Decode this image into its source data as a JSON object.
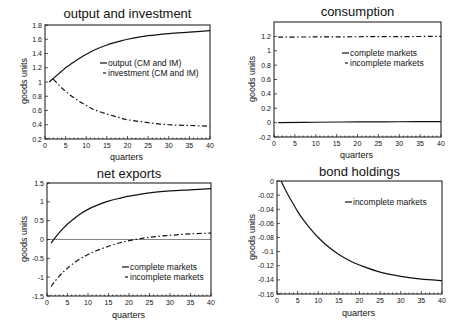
{
  "chart_data": [
    {
      "id": "output",
      "type": "line",
      "title": "output and investment",
      "xlabel": "quarters",
      "ylabel": "goods units",
      "xlim": [
        0,
        40
      ],
      "ylim": [
        0.2,
        1.8
      ],
      "xticks": [
        0,
        5,
        10,
        15,
        20,
        25,
        30,
        35,
        40
      ],
      "yticks": [
        0.2,
        0.4,
        0.6,
        0.8,
        1,
        1.2,
        1.4,
        1.6,
        1.8
      ],
      "ytick_labels": [
        "0.2",
        "0.4",
        "0.6",
        "0.8",
        "1",
        "1.2",
        "1.4",
        "1.6",
        "1.8"
      ],
      "grid": false,
      "legend_position": "center-right",
      "frame": {
        "left": 45,
        "top": 25,
        "right": 210,
        "bottom": 139
      },
      "legend": {
        "x": 100,
        "y": 66
      },
      "series": [
        {
          "name": "output (CM and IM)",
          "style": "solid",
          "x": [
            1,
            2,
            3,
            4,
            5,
            6,
            8,
            10,
            12,
            15,
            18,
            20,
            25,
            30,
            35,
            40
          ],
          "values": [
            1.0,
            1.05,
            1.1,
            1.15,
            1.2,
            1.24,
            1.32,
            1.39,
            1.45,
            1.52,
            1.57,
            1.6,
            1.65,
            1.68,
            1.7,
            1.72
          ]
        },
        {
          "name": "investment (CM and IM)",
          "style": "dashdot",
          "x": [
            2,
            3,
            4,
            5,
            6,
            8,
            10,
            12,
            15,
            18,
            20,
            25,
            30,
            35,
            40
          ],
          "values": [
            1.04,
            0.98,
            0.92,
            0.87,
            0.82,
            0.74,
            0.67,
            0.61,
            0.55,
            0.5,
            0.47,
            0.43,
            0.4,
            0.39,
            0.38
          ]
        }
      ]
    },
    {
      "id": "consumption",
      "type": "line",
      "title": "consumption",
      "xlabel": "quarters",
      "ylabel": "goods units",
      "xlim": [
        0,
        40
      ],
      "ylim": [
        -0.2,
        1.4
      ],
      "xticks": [
        0,
        5,
        10,
        15,
        20,
        25,
        30,
        35,
        40
      ],
      "yticks": [
        -0.2,
        0,
        0.2,
        0.4,
        0.6,
        0.8,
        1,
        1.2
      ],
      "ytick_labels": [
        "-0.2",
        "0",
        "0.2",
        "0.4",
        "0.6",
        "0.8",
        "1",
        "1.2"
      ],
      "grid": false,
      "legend_position": "upper-right",
      "frame": {
        "left": 274,
        "top": 22,
        "right": 441,
        "bottom": 137
      },
      "legend": {
        "x": 342,
        "y": 56
      },
      "series": [
        {
          "name": "complete markets",
          "style": "solid",
          "x": [
            1,
            10,
            20,
            30,
            40
          ],
          "values": [
            0.0,
            0.005,
            0.01,
            0.012,
            0.015
          ]
        },
        {
          "name": "incomplete markets",
          "style": "dashdot",
          "x": [
            1,
            10,
            20,
            30,
            40
          ],
          "values": [
            1.19,
            1.192,
            1.195,
            1.197,
            1.2
          ]
        }
      ]
    },
    {
      "id": "netexports",
      "type": "line",
      "title": "net exports",
      "xlabel": "quarters",
      "ylabel": "goods units",
      "xlim": [
        0,
        40
      ],
      "ylim": [
        -1.5,
        1.5
      ],
      "xticks": [
        0,
        5,
        10,
        15,
        20,
        25,
        30,
        35,
        40
      ],
      "yticks": [
        -1.5,
        -1,
        -0.5,
        0,
        0.5,
        1,
        1.5
      ],
      "ytick_labels": [
        "-1.5",
        "-1",
        "-0.5",
        "0",
        "0.5",
        "1",
        "1.5"
      ],
      "grid": false,
      "zero_line": true,
      "legend_position": "lower-right",
      "frame": {
        "left": 47,
        "top": 183,
        "right": 211,
        "bottom": 296
      },
      "legend": {
        "x": 122,
        "y": 270
      },
      "series": [
        {
          "name": "complete markets",
          "style": "solid",
          "x": [
            1,
            2,
            3,
            4,
            5,
            6,
            8,
            10,
            12,
            15,
            18,
            20,
            25,
            30,
            35,
            40
          ],
          "values": [
            -0.1,
            0.05,
            0.18,
            0.3,
            0.41,
            0.5,
            0.67,
            0.8,
            0.9,
            1.02,
            1.1,
            1.15,
            1.24,
            1.29,
            1.32,
            1.35
          ]
        },
        {
          "name": "incomplete markets",
          "style": "dashdot",
          "x": [
            1,
            2,
            3,
            4,
            5,
            6,
            8,
            10,
            12,
            15,
            18,
            20,
            25,
            30,
            35,
            40
          ],
          "values": [
            -1.25,
            -1.1,
            -0.97,
            -0.86,
            -0.76,
            -0.67,
            -0.52,
            -0.4,
            -0.3,
            -0.18,
            -0.08,
            -0.03,
            0.06,
            0.11,
            0.15,
            0.17
          ]
        }
      ]
    },
    {
      "id": "bonds",
      "type": "line",
      "title": "bond holdings",
      "xlabel": "quarters",
      "ylabel": "goods units",
      "xlim": [
        0,
        40
      ],
      "ylim": [
        -0.16,
        0
      ],
      "xticks": [
        0,
        5,
        10,
        15,
        20,
        25,
        30,
        35,
        40
      ],
      "yticks": [
        -0.16,
        -0.14,
        -0.12,
        -0.1,
        -0.08,
        -0.06,
        -0.04,
        -0.02,
        0
      ],
      "ytick_labels": [
        "-0.16",
        "-0.14",
        "-0.12",
        "-0.1",
        "-0.08",
        "-0.06",
        "-0.04",
        "-0.02",
        "0"
      ],
      "grid": false,
      "legend_position": "upper-right",
      "frame": {
        "left": 277,
        "top": 181,
        "right": 442,
        "bottom": 294
      },
      "legend": {
        "x": 345,
        "y": 205
      },
      "series": [
        {
          "name": "incomplete markets",
          "style": "solid",
          "x": [
            1,
            2,
            3,
            4,
            5,
            6,
            8,
            10,
            12,
            15,
            18,
            20,
            25,
            30,
            35,
            40
          ],
          "values": [
            0.0,
            -0.012,
            -0.023,
            -0.033,
            -0.043,
            -0.052,
            -0.067,
            -0.08,
            -0.091,
            -0.104,
            -0.114,
            -0.119,
            -0.129,
            -0.135,
            -0.139,
            -0.141
          ]
        }
      ]
    }
  ],
  "panels": {
    "output": {
      "title": "output and investment",
      "ylabel": "goods units",
      "xlabel": "quarters"
    },
    "consumption": {
      "title": "consumption",
      "ylabel": "goods units",
      "xlabel": "quarters"
    },
    "netexports": {
      "title": "net exports",
      "ylabel": "goods units",
      "xlabel": "quarters"
    },
    "bonds": {
      "title": "bond holdings",
      "ylabel": "goods units",
      "xlabel": "quarters"
    }
  }
}
